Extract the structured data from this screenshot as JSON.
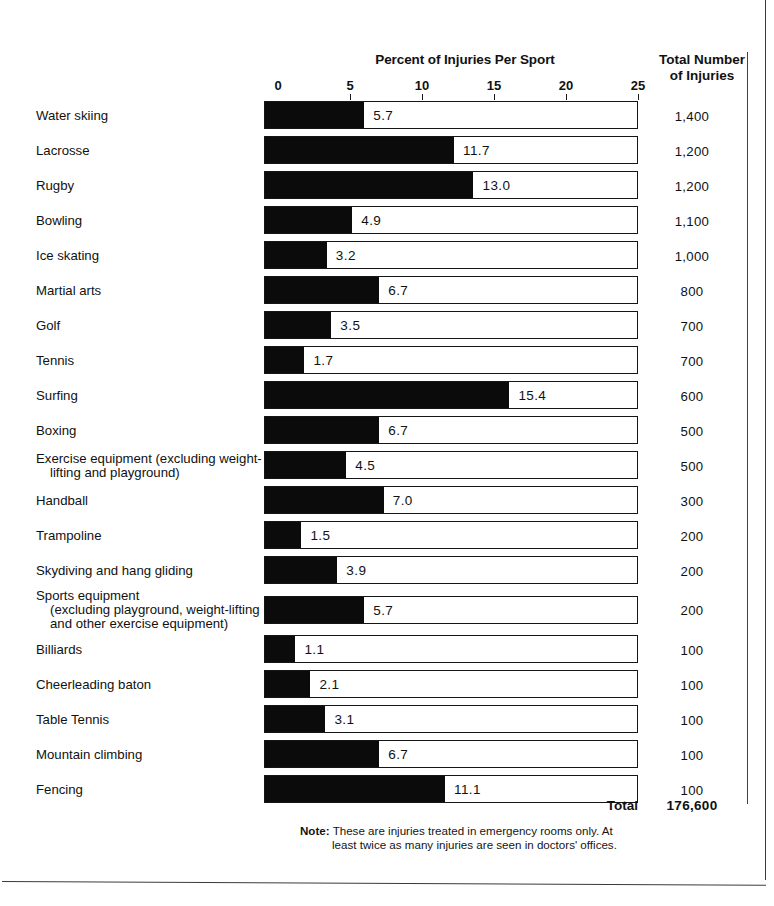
{
  "header": {
    "chart_title": "Percent of Injuries Per Sport",
    "totals_header_line1": "Total Number",
    "totals_header_line2": "of Injuries"
  },
  "footer": {
    "total_label": "Total",
    "total_value": "176,600",
    "note_label": "Note:",
    "note_line1": "These are injuries treated in emergency rooms only. At",
    "note_line2": "least twice as many injuries are seen in doctors' offices."
  },
  "axis": {
    "ticks": [
      "0",
      "5",
      "10",
      "15",
      "20",
      "25"
    ],
    "min": 0,
    "max": 25
  },
  "colors": {
    "bar_fill": "#0b0b0b",
    "bar_outline": "#151515",
    "text": "#111111",
    "background": "#ffffff"
  },
  "chart_data": {
    "type": "bar",
    "title": "Percent of Injuries Per Sport",
    "xlabel": "Percent of Injuries Per Sport",
    "ylabel": "",
    "xlim": [
      0,
      25
    ],
    "grid": false,
    "legend": "none",
    "orientation": "horizontal",
    "categories": [
      "Water skiing",
      "Lacrosse",
      "Rugby",
      "Bowling",
      "Ice skating",
      "Martial arts",
      "Golf",
      "Tennis",
      "Surfing",
      "Boxing",
      "Exercise equipment (excluding weight-lifting and playground)",
      "Handball",
      "Trampoline",
      "Skydiving and hang gliding",
      "Sports equipment (excluding playground, weight-lifting and other exercise equipment)",
      "Billiards",
      "Cheerleading baton",
      "Table Tennis",
      "Mountain climbing",
      "Fencing"
    ],
    "values": [
      5.7,
      11.7,
      13.0,
      4.9,
      3.2,
      6.7,
      3.5,
      1.7,
      15.4,
      6.7,
      4.5,
      7.0,
      1.5,
      3.9,
      5.7,
      1.1,
      2.1,
      3.1,
      6.7,
      11.1
    ],
    "value_labels": [
      "5.7",
      "11.7",
      "13.0",
      "4.9",
      "3.2",
      "6.7",
      "3.5",
      "1.7",
      "15.4",
      "6.7",
      "4.5",
      "7.0",
      "1.5",
      "3.9",
      "5.7",
      "1.1",
      "2.1",
      "3.1",
      "6.7",
      "11.1"
    ],
    "secondary_series": {
      "name": "Total Number of Injuries",
      "values": [
        1400,
        1200,
        1200,
        1100,
        1000,
        800,
        700,
        700,
        600,
        500,
        500,
        300,
        200,
        200,
        200,
        100,
        100,
        100,
        100,
        100
      ],
      "labels": [
        "1,400",
        "1,200",
        "1,200",
        "1,100",
        "1,000",
        "800",
        "700",
        "700",
        "600",
        "500",
        "500",
        "300",
        "200",
        "200",
        "200",
        "100",
        "100",
        "100",
        "100",
        "100"
      ],
      "total_label": "Total",
      "total": "176,600"
    }
  },
  "rows": [
    {
      "label_lines": [
        "Water skiing"
      ],
      "value": 5.7,
      "value_label": "5.7",
      "total": "1,400"
    },
    {
      "label_lines": [
        "Lacrosse"
      ],
      "value": 11.7,
      "value_label": "11.7",
      "total": "1,200"
    },
    {
      "label_lines": [
        "Rugby"
      ],
      "value": 13.0,
      "value_label": "13.0",
      "total": "1,200"
    },
    {
      "label_lines": [
        "Bowling"
      ],
      "value": 4.9,
      "value_label": "4.9",
      "total": "1,100"
    },
    {
      "label_lines": [
        "Ice skating"
      ],
      "value": 3.2,
      "value_label": "3.2",
      "total": "1,000"
    },
    {
      "label_lines": [
        "Martial  arts"
      ],
      "value": 6.7,
      "value_label": "6.7",
      "total": "800"
    },
    {
      "label_lines": [
        "Golf"
      ],
      "value": 3.5,
      "value_label": "3.5",
      "total": "700"
    },
    {
      "label_lines": [
        "Tennis"
      ],
      "value": 1.7,
      "value_label": "1.7",
      "total": "700"
    },
    {
      "label_lines": [
        "Surfing"
      ],
      "value": 15.4,
      "value_label": "15.4",
      "total": "600"
    },
    {
      "label_lines": [
        "Boxing"
      ],
      "value": 6.7,
      "value_label": "6.7",
      "total": "500"
    },
    {
      "label_lines": [
        "Exercise equipment (excluding weight-",
        "lifting and playground)"
      ],
      "value": 4.5,
      "value_label": "4.5",
      "total": "500"
    },
    {
      "label_lines": [
        "Handball"
      ],
      "value": 7.0,
      "value_label": "7.0",
      "total": "300"
    },
    {
      "label_lines": [
        "Trampoline"
      ],
      "value": 1.5,
      "value_label": "1.5",
      "total": "200"
    },
    {
      "label_lines": [
        "Skydiving and hang gliding"
      ],
      "value": 3.9,
      "value_label": "3.9",
      "total": "200"
    },
    {
      "label_lines": [
        "Sports equipment",
        "(excluding playground,  weight-lifting",
        "and other exercise equipment)"
      ],
      "value": 5.7,
      "value_label": "5.7",
      "total": "200"
    },
    {
      "label_lines": [
        "Billiards"
      ],
      "value": 1.1,
      "value_label": "1.1",
      "total": "100"
    },
    {
      "label_lines": [
        "Cheerleading baton"
      ],
      "value": 2.1,
      "value_label": "2.1",
      "total": "100"
    },
    {
      "label_lines": [
        "Table Tennis"
      ],
      "value": 3.1,
      "value_label": "3.1",
      "total": "100"
    },
    {
      "label_lines": [
        "Mountain climbing"
      ],
      "value": 6.7,
      "value_label": "6.7",
      "total": "100"
    },
    {
      "label_lines": [
        "Fencing"
      ],
      "value": 11.1,
      "value_label": "11.1",
      "total": "100"
    }
  ]
}
